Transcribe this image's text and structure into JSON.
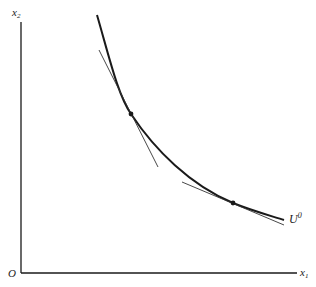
{
  "diagram": {
    "type": "indifference-curve",
    "axes": {
      "x_label": "x",
      "x_sub": "1",
      "y_label": "x",
      "y_sub": "2",
      "origin_label": "O"
    },
    "curve_label": "U",
    "curve_label_sup": "0",
    "tangent_points": 2
  },
  "colors": {
    "line": "#1a1a1a",
    "background": "#ffffff"
  }
}
